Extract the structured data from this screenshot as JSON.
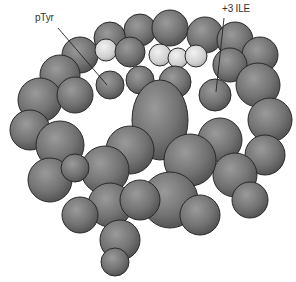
{
  "figure": {
    "type": "molecular-surface-rendering",
    "background": "#ffffff",
    "surface_color": "#7a7a7a",
    "highlight_color": "#d8d8d8",
    "outline_color": "#2a2a2a"
  },
  "annotations": [
    {
      "label": "pTyr",
      "text_pos": [
        35,
        12
      ],
      "line": [
        [
          58,
          28
        ],
        [
          107,
          85
        ]
      ]
    },
    {
      "label": "+3 ILE",
      "text_pos": [
        222,
        3
      ],
      "line": [
        [
          224,
          18
        ],
        [
          216,
          92
        ]
      ]
    }
  ]
}
